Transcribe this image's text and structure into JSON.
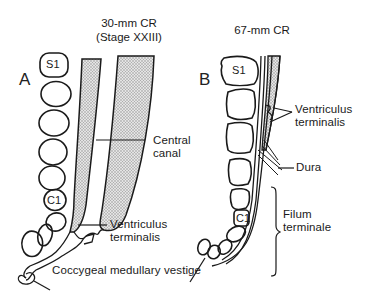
{
  "panel_a": {
    "letter": "A",
    "title_line1": "30-mm CR",
    "title_line2": "(Stage XXIII)",
    "vertebra_top": "S1",
    "vertebra_coccygeal": "C1",
    "labels": {
      "central_canal_1": "Central",
      "central_canal_2": "canal",
      "ventriculus_1": "Ventriculus",
      "ventriculus_2": "terminalis",
      "coccygeal": "Coccygeal medullary vestige"
    }
  },
  "panel_b": {
    "letter": "B",
    "title": "67-mm CR",
    "vertebra_top": "S1",
    "vertebra_coccygeal": "C1",
    "labels": {
      "ventriculus_1": "Ventriculus",
      "ventriculus_2": "terminalis",
      "dura": "Dura",
      "filum_1": "Filum",
      "filum_2": "terminale"
    }
  },
  "colors": {
    "ink": "#1a1a1a",
    "stipple": "#cfcfcf",
    "background": "#ffffff"
  }
}
